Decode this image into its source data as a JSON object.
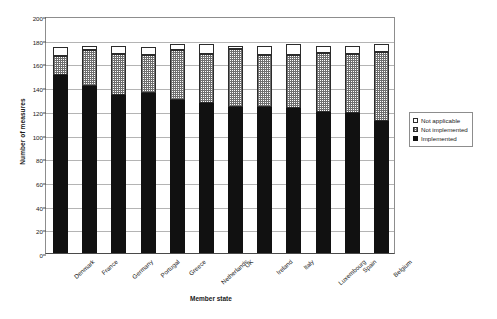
{
  "chart_data": {
    "type": "bar",
    "stacked": true,
    "title": "",
    "xlabel": "Member state",
    "ylabel": "Number of measures",
    "ylim": [
      0,
      200
    ],
    "ytick_step": 20,
    "yticks": [
      0,
      20,
      40,
      60,
      80,
      100,
      120,
      140,
      160,
      180,
      200
    ],
    "grid": true,
    "legend_position": "right",
    "categories": [
      "Denmark",
      "France",
      "Germany",
      "Portugal",
      "Greece",
      "Netherlands",
      "UK",
      "Ireland",
      "Italy",
      "Luxembourg",
      "Spain",
      "Belgium"
    ],
    "series": [
      {
        "name": "Implemented",
        "color": "#111111",
        "values": [
          150,
          141,
          133,
          135,
          129,
          127,
          123,
          123,
          122,
          119,
          118,
          111
        ]
      },
      {
        "name": "Not implemented",
        "color": "#dcdcdc",
        "values": [
          16,
          30,
          35,
          32,
          42,
          41,
          49,
          44,
          45,
          50,
          50,
          59
        ]
      },
      {
        "name": "Not applicable",
        "color": "#ffffff",
        "values": [
          8,
          4,
          7,
          7,
          5,
          8,
          3,
          8,
          9,
          6,
          7,
          6
        ]
      }
    ],
    "totals": [
      174,
      175,
      175,
      174,
      176,
      176,
      175,
      175,
      176,
      175,
      175,
      176
    ]
  },
  "legend": {
    "items": [
      {
        "label": "Not applicable",
        "swatch": "sw-not-applicable"
      },
      {
        "label": "Not implemented",
        "swatch": "sw-not-implemented"
      },
      {
        "label": "Implemented",
        "swatch": "sw-implemented"
      }
    ]
  }
}
